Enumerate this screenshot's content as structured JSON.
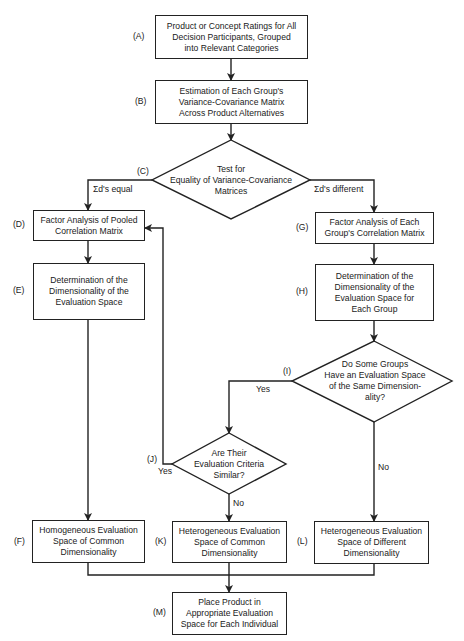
{
  "nodes": {
    "A": {
      "label": "(A)",
      "lines": [
        "Product or Concept Ratings for All",
        "Decision Participants, Grouped",
        "into Relevant Categories"
      ]
    },
    "B": {
      "label": "(B)",
      "lines": [
        "Estimation of Each Group's",
        "Variance-Covariance Matrix",
        "Across Product Alternatives"
      ]
    },
    "C": {
      "label": "(C)",
      "lines": [
        "Test for",
        "Equality of Variance-Covariance",
        "Matrices"
      ]
    },
    "D": {
      "label": "(D)",
      "lines": [
        "Factor Analysis of Pooled",
        "Correlation Matrix"
      ]
    },
    "E": {
      "label": "(E)",
      "lines": [
        "Determination of the",
        "Dimensionality of the",
        "Evaluation Space"
      ]
    },
    "F": {
      "label": "(F)",
      "lines": [
        "Homogeneous Evaluation",
        "Space of Common",
        "Dimensionality"
      ]
    },
    "G": {
      "label": "(G)",
      "lines": [
        "Factor Analysis of Each",
        "Group's Correlation Matrix"
      ]
    },
    "H": {
      "label": "(H)",
      "lines": [
        "Determination of the",
        "Dimensionality of the",
        "Evaluation Space for",
        "Each Group"
      ]
    },
    "I": {
      "label": "(I)",
      "lines": [
        "Do Some Groups",
        "Have an Evaluation Space",
        "of the Same Dimension-",
        "ality?"
      ]
    },
    "J": {
      "label": "(J)",
      "lines": [
        "Are Their",
        "Evaluation Criteria",
        "Similar?"
      ]
    },
    "K": {
      "label": "(K)",
      "lines": [
        "Heterogeneous Evaluation",
        "Space of Common",
        "Dimensionality"
      ]
    },
    "L": {
      "label": "(L)",
      "lines": [
        "Heterogeneous Evaluation",
        "Space of Different",
        "Dimensionality"
      ]
    },
    "M": {
      "label": "(M)",
      "lines": [
        "Place Product in",
        "Appropriate Evaluation",
        "Space for Each Individual"
      ]
    }
  },
  "edge_labels": {
    "c_equal": "Σd's equal",
    "c_different": "Σd's different",
    "i_yes": "Yes",
    "i_no": "No",
    "j_yes": "Yes",
    "j_no": "No"
  }
}
